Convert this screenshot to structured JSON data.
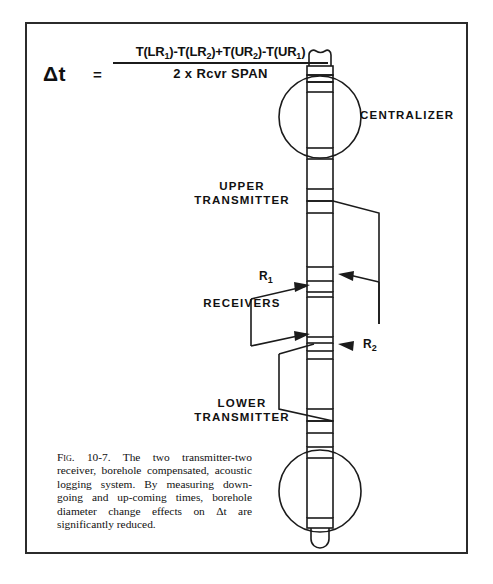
{
  "figure": {
    "formula": {
      "lhs": "Δt",
      "equals": "=",
      "numerator_parts": [
        {
          "fn": "T(LR",
          "sub": "1",
          "close": ")"
        },
        {
          "op": "-"
        },
        {
          "fn": "T(LR",
          "sub": "2",
          "close": ")"
        },
        {
          "op": "+"
        },
        {
          "fn": "T(UR",
          "sub": "2",
          "close": ")"
        },
        {
          "op": "-"
        },
        {
          "fn": "T(UR",
          "sub": "1",
          "close": ")"
        }
      ],
      "numerator_text": "T(LR₁) - T(LR₂) + T(UR₂) - T(UR₁)",
      "denominator": "2 x Rcvr SPAN"
    },
    "labels": {
      "centralizer": "CENTRALIZER",
      "upper_transmitter": "UPPER\nTRANSMITTER",
      "receivers": "RECEIVERS",
      "lower_transmitter": "LOWER\nTRANSMITTER",
      "receiver_1": "R",
      "receiver_1_sub": "1",
      "receiver_2": "R",
      "receiver_2_sub": "2"
    },
    "caption": {
      "fig_number": "Fig. 10-7.",
      "text": "The two transmitter-two receiver, borehole compensated, acoustic logging system. By measuring down-going and up-coming times, borehole diameter change effects on Δt are significantly reduced."
    },
    "colors": {
      "ink": "#1b1b1b",
      "border": "#2b2b2b",
      "background": "#ffffff"
    }
  }
}
